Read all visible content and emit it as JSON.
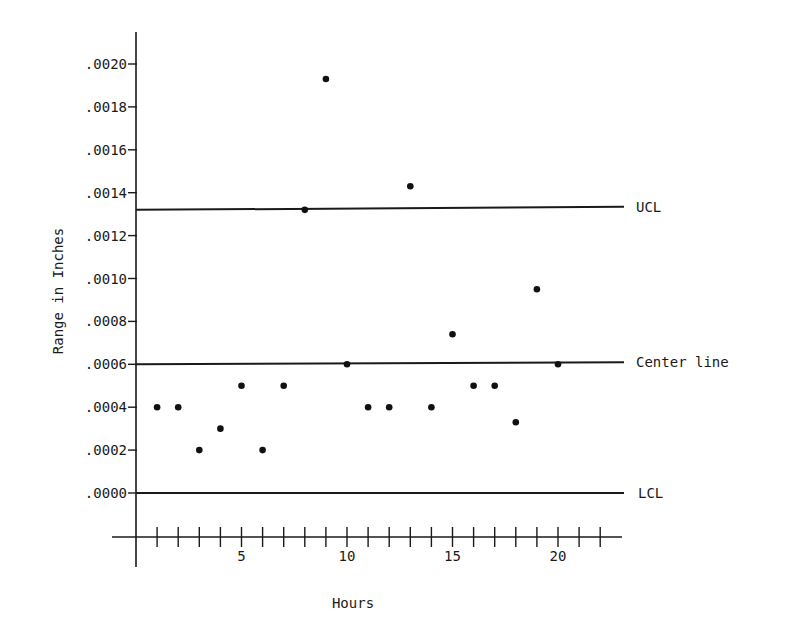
{
  "chart_data": {
    "type": "scatter",
    "title": "",
    "xlabel": "Hours",
    "ylabel": "Range in Inches",
    "x_ticks": [
      1,
      2,
      3,
      4,
      5,
      6,
      7,
      8,
      9,
      10,
      11,
      12,
      13,
      14,
      15,
      16,
      17,
      18,
      19,
      20,
      21,
      22
    ],
    "x_tick_labels": [
      {
        "value": 5,
        "label": "5"
      },
      {
        "value": 10,
        "label": "10"
      },
      {
        "value": 15,
        "label": "15"
      },
      {
        "value": 20,
        "label": "20"
      }
    ],
    "y_ticks": [
      {
        "value": 0.0,
        "label": ".0000"
      },
      {
        "value": 0.0002,
        "label": ".0002"
      },
      {
        "value": 0.0004,
        "label": ".0004"
      },
      {
        "value": 0.0006,
        "label": ".0006"
      },
      {
        "value": 0.0008,
        "label": ".0008"
      },
      {
        "value": 0.001,
        "label": ".0010"
      },
      {
        "value": 0.0012,
        "label": ".0012"
      },
      {
        "value": 0.0014,
        "label": ".0014"
      },
      {
        "value": 0.0016,
        "label": ".0016"
      },
      {
        "value": 0.0018,
        "label": ".0018"
      },
      {
        "value": 0.002,
        "label": ".0020"
      }
    ],
    "xlim": [
      0,
      23
    ],
    "ylim": [
      0,
      0.0021
    ],
    "grid": false,
    "legend": null,
    "series": [
      {
        "name": "Range",
        "x": [
          1,
          2,
          3,
          4,
          5,
          6,
          7,
          8,
          9,
          10,
          11,
          12,
          13,
          14,
          15,
          16,
          17,
          18,
          19,
          20
        ],
        "values": [
          0.0004,
          0.0004,
          0.0002,
          0.0003,
          0.0005,
          0.0002,
          0.0005,
          0.00132,
          0.00193,
          0.0006,
          0.0004,
          0.0004,
          0.00143,
          0.0004,
          0.00074,
          0.0005,
          0.0005,
          0.00033,
          0.00095,
          0.0006
        ]
      }
    ],
    "reference_lines": [
      {
        "name": "UCL",
        "label": "UCL",
        "value": 0.00132
      },
      {
        "name": "Center line",
        "label": "Center line",
        "value": 0.0006
      },
      {
        "name": "LCL",
        "label": "LCL",
        "value": 0.0
      }
    ]
  }
}
